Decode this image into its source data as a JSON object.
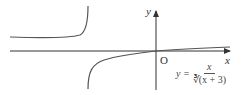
{
  "diagram": {
    "axes": {
      "x_label": "x",
      "y_label": "y",
      "origin_label": "O"
    },
    "formula": {
      "lhs": "y =",
      "numerator": "x",
      "denominator_root_index": "3",
      "denominator": "∛(x + 3)"
    },
    "colors": {
      "curve": "#555555",
      "axis": "#333333"
    }
  }
}
